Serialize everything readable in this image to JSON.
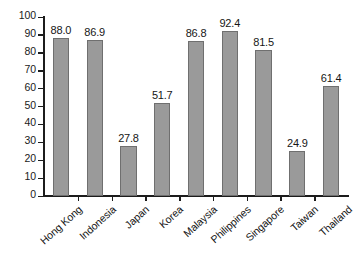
{
  "chart_data": {
    "type": "bar",
    "title": "",
    "subtitle": "",
    "xlabel": "",
    "ylabel": "",
    "categories": [
      "Hong Kong",
      "Indonesia",
      "Japan",
      "Korea",
      "Malaysia",
      "Philippines",
      "Singapore",
      "Taiwan",
      "Thailand"
    ],
    "values": [
      88.0,
      86.9,
      27.8,
      51.7,
      86.8,
      92.4,
      81.5,
      24.9,
      61.4
    ],
    "value_labels": [
      "88.0",
      "86.9",
      "27.8",
      "51.7",
      "86.8",
      "92.4",
      "81.5",
      "24.9",
      "61.4"
    ],
    "ylim": [
      0,
      100
    ],
    "ytick_values": [
      0,
      10,
      20,
      30,
      40,
      50,
      60,
      70,
      80,
      90,
      100
    ],
    "ytick_labels": [
      "0",
      "10",
      "20",
      "30",
      "40",
      "50",
      "60",
      "70",
      "80",
      "90",
      "100"
    ],
    "grid": false,
    "legend": null,
    "legend_position": "none",
    "bar_color": "#9a9a9a",
    "bar_edge_color": "#6f6f6f",
    "axis_color": "#1c1c1c",
    "background_color": "#ffffff",
    "xtick_label_rotation": -42
  }
}
